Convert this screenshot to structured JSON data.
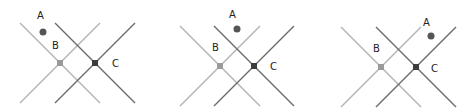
{
  "figure": {
    "colors": {
      "light_lines": "#b4b4b4",
      "dark_lines": "#6e6e6e",
      "point_a": "#555555",
      "point_b": "#9a9a9a",
      "point_c": "#3c3c3c",
      "label": "#222222"
    },
    "panels": [
      {
        "id": 1,
        "labels": {
          "a": "A",
          "b": "B",
          "c": "C"
        },
        "a_position": "upper-left, outside both X shapes' crossing region"
      },
      {
        "id": 2,
        "labels": {
          "a": "A",
          "b": "B",
          "c": "C"
        },
        "a_position": "top-center, above the overlap of the two X shapes"
      },
      {
        "id": 3,
        "labels": {
          "a": "A",
          "b": "B",
          "c": "C"
        },
        "a_position": "upper-right, beyond the dark X shape"
      }
    ]
  }
}
